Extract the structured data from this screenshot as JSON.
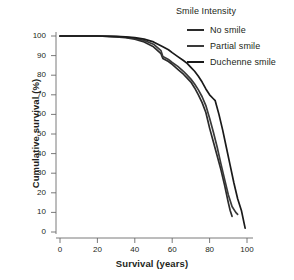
{
  "chart_data": {
    "type": "line",
    "title": "",
    "xlabel": "Survival (years)",
    "ylabel": "Cumulative survival (%)",
    "xlim": [
      0,
      105
    ],
    "ylim": [
      0,
      100
    ],
    "xticks": [
      0,
      20,
      40,
      60,
      80,
      100
    ],
    "yticks": [
      0,
      10,
      20,
      30,
      40,
      50,
      60,
      70,
      80,
      90,
      100
    ],
    "grid": false,
    "legend_title": "Smile Intensity",
    "legend_position": "top-right",
    "series": [
      {
        "name": "No smile",
        "color": "#2b2b2b",
        "x": [
          0,
          10,
          20,
          30,
          35,
          40,
          45,
          50,
          54,
          55,
          58,
          60,
          63,
          66,
          68,
          70,
          72,
          74,
          76,
          78,
          79,
          80,
          82,
          84,
          86,
          88,
          90,
          91,
          92
        ],
        "y": [
          100,
          100,
          100,
          99.6,
          99.2,
          98.4,
          97,
          94.5,
          91,
          88.5,
          87,
          85.5,
          83,
          80.5,
          78.5,
          76.5,
          73.5,
          70,
          66,
          61,
          57,
          53,
          46,
          39,
          32,
          24,
          15,
          11,
          8
        ]
      },
      {
        "name": "Partial smile",
        "color": "#3a3a3a",
        "x": [
          0,
          10,
          20,
          30,
          35,
          40,
          45,
          50,
          54,
          55,
          58,
          60,
          63,
          66,
          68,
          70,
          72,
          74,
          76,
          78,
          80,
          82,
          84,
          86,
          88,
          90,
          92,
          94,
          95
        ],
        "y": [
          100,
          100,
          100,
          99.7,
          99.4,
          98.8,
          97.7,
          95.8,
          92.5,
          89.5,
          88,
          86.5,
          84.5,
          82,
          80,
          78,
          75.5,
          72.5,
          69,
          64.5,
          58,
          51,
          43.5,
          35,
          27,
          19,
          13,
          10,
          9
        ]
      },
      {
        "name": "Duchenne smile",
        "color": "#1a1a1a",
        "x": [
          0,
          10,
          20,
          30,
          35,
          40,
          45,
          50,
          55,
          58,
          60,
          63,
          66,
          68,
          70,
          72,
          74,
          76,
          78,
          80,
          82,
          83,
          85,
          87,
          89,
          91,
          93,
          95,
          97,
          99
        ],
        "y": [
          100,
          100,
          100,
          99.8,
          99.6,
          99.2,
          98.4,
          97,
          94.5,
          93,
          91.5,
          89.5,
          87.5,
          86,
          84,
          82,
          79.5,
          76.5,
          73,
          70,
          68,
          67,
          60,
          52,
          43,
          34,
          25,
          17,
          11,
          2
        ]
      }
    ]
  },
  "axes": {
    "x_tick_labels": [
      "0",
      "20",
      "40",
      "60",
      "80",
      "100"
    ],
    "y_tick_labels": [
      "0",
      "10",
      "20",
      "30",
      "40",
      "50",
      "60",
      "70",
      "80",
      "90",
      "100"
    ],
    "x_title": "Survival (years)",
    "y_title": "Cumulative survival (%)"
  },
  "legend": {
    "title": "Smile Intensity",
    "items": [
      {
        "label": "No smile",
        "color": "#2b2b2b"
      },
      {
        "label": "Partial smile",
        "color": "#3a3a3a"
      },
      {
        "label": "Duchenne smile",
        "color": "#1a1a1a"
      }
    ]
  }
}
